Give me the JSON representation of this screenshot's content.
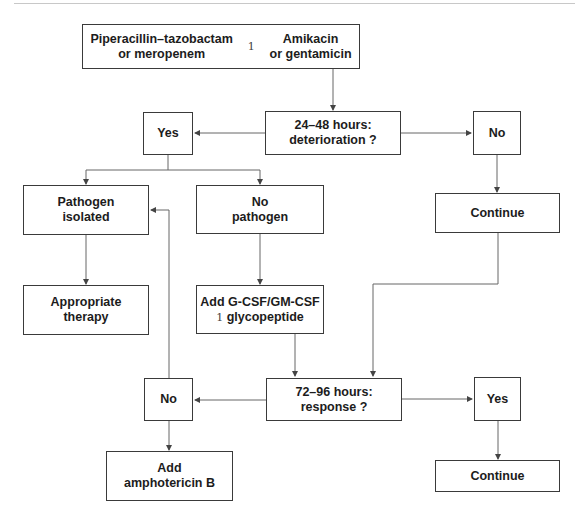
{
  "diagram": {
    "start": {
      "left_drug": [
        "Piperacillin–tazobactam",
        "or meropenem"
      ],
      "connector": "1",
      "right_drug": [
        "Amikacin",
        "or gentamicin"
      ]
    },
    "decision_1": [
      "24–48 hours:",
      "deterioration ?"
    ],
    "decision_1_yes": "Yes",
    "decision_1_no": "No",
    "continue_1": "Continue",
    "pathogen_isolated": [
      "Pathogen",
      "isolated"
    ],
    "no_pathogen": [
      "No",
      "pathogen"
    ],
    "appropriate_therapy": [
      "Appropriate",
      "therapy"
    ],
    "add_gcsf": {
      "line1": "Add G-CSF/GM-CSF",
      "connector": "1",
      "line2": "glycopeptide"
    },
    "decision_2": [
      "72–96 hours:",
      "response ?"
    ],
    "decision_2_no": "No",
    "decision_2_yes": "Yes",
    "add_amphotericin": [
      "Add",
      "amphotericin B"
    ],
    "continue_2": "Continue"
  },
  "colors": {
    "line": "#555555",
    "border": "#3a3a3a",
    "text": "#1c1c1c"
  }
}
